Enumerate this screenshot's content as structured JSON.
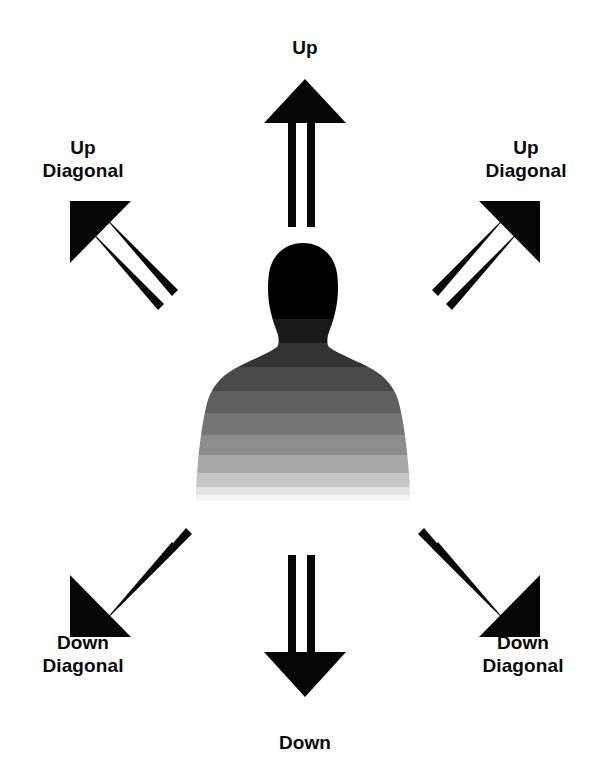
{
  "canvas": {
    "width": 610,
    "height": 775,
    "background": "#ffffff"
  },
  "diagram": {
    "type": "direction-reference-diagram",
    "ink_color": "#060606",
    "label_color": "#0a0a0a"
  },
  "labels": {
    "up": "Up",
    "down": "Down",
    "up_diagonal_left": "Up\nDiagonal",
    "up_diagonal_right": "Up\nDiagonal",
    "down_diagonal_left": "Down\nDiagonal",
    "down_diagonal_right": "Down\nDiagonal"
  },
  "arrows": [
    {
      "name": "arrow-up",
      "direction": "up",
      "angle_deg": 90,
      "style": "open-outline-shaft"
    },
    {
      "name": "arrow-down",
      "direction": "down",
      "angle_deg": 270,
      "style": "open-outline-shaft"
    },
    {
      "name": "arrow-up-left",
      "direction": "up-left",
      "angle_deg": 135,
      "style": "open-outline-shaft"
    },
    {
      "name": "arrow-up-right",
      "direction": "up-right",
      "angle_deg": 45,
      "style": "open-outline-shaft"
    },
    {
      "name": "arrow-down-left",
      "direction": "down-left",
      "angle_deg": 225,
      "style": "open-outline-shaft"
    },
    {
      "name": "arrow-down-right",
      "direction": "down-right",
      "angle_deg": 315,
      "style": "open-outline-shaft"
    }
  ],
  "figure": {
    "name": "person-silhouette",
    "gradient_from": "#000000",
    "gradient_to": "#f4f4f4",
    "band_count": 11
  }
}
